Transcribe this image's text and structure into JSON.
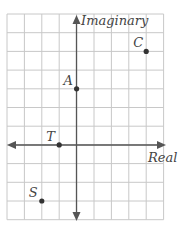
{
  "diagram": {
    "type": "complex-plane",
    "axes": {
      "horizontal_label": "Real",
      "vertical_label": "Imaginary"
    },
    "grid": {
      "columns": 9,
      "rows": 11,
      "origin_col": 4,
      "origin_row": 7
    },
    "points": [
      {
        "label": "A",
        "re": 0,
        "im": 3
      },
      {
        "label": "C",
        "re": 4,
        "im": 5
      },
      {
        "label": "T",
        "re": -1,
        "im": 0
      },
      {
        "label": "S",
        "re": -2,
        "im": -3
      }
    ],
    "colors": {
      "grid": "#c8c8c8",
      "axis": "#555555",
      "point": "#333333"
    }
  }
}
